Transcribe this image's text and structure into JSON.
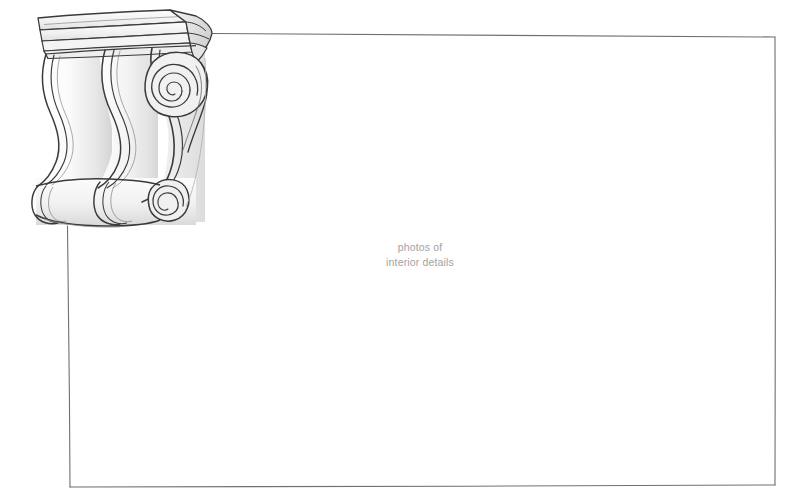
{
  "canvas": {
    "width": 788,
    "height": 502,
    "background_color": "#ffffff"
  },
  "frame": {
    "name": "content-frame",
    "stroke_color": "#6e7076",
    "stroke_width": 1.1,
    "corners": {
      "top_left": [
        69,
        33
      ],
      "top_right": [
        775,
        37
      ],
      "bottom_right": [
        775,
        485
      ],
      "bottom_left": [
        70,
        487
      ]
    },
    "top_edge_start_x": 212,
    "left_edge_start_y": 226,
    "note_visible": "top and left edges are interrupted by the corbel drawing"
  },
  "caption": {
    "line1": "photos of",
    "line2": "interior details",
    "color": "#a2a2a2",
    "font_size_px": 10.5,
    "align": "center",
    "center_x": 420,
    "top_y": 240
  },
  "illustration": {
    "name": "architectural-corbel",
    "style": "hand-drawn pencil line art with light gray shading",
    "bounds": {
      "x": 28,
      "y": 8,
      "width": 190,
      "height": 224
    },
    "ink_color": "#3a3a3c",
    "ink_color_light": "#6a6a6e",
    "fill_light": "#fbfbfb",
    "fill_mid": "#ececec",
    "fill_shadow": "#d8d8d8",
    "parts": [
      {
        "name": "cornice-abacus",
        "description": "tilted top slab with three horizontal molding bands"
      },
      {
        "name": "cornice-side-face",
        "description": "angled perspective end cap at right of cornice"
      },
      {
        "name": "ogee-lobe-left",
        "description": "S-curve scroll profile with double contour lines"
      },
      {
        "name": "ogee-lobe-center",
        "description": "S-curve scroll profile with double contour lines"
      },
      {
        "name": "ogee-lobe-right",
        "description": "S-curve scroll profile terminating in volute"
      },
      {
        "name": "volute-upper",
        "description": "large spiral scroll, ~2.5 turns, center near (172,88)"
      },
      {
        "name": "volute-lower",
        "description": "small tight spiral scroll, center near (166,200)"
      },
      {
        "name": "base-roll-band",
        "description": "rolled cylindrical base band with three lobed segments"
      }
    ]
  }
}
